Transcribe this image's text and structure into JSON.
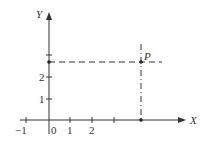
{
  "diagram": {
    "title": "",
    "axes": {
      "x_label": "X",
      "y_label": "Y"
    },
    "x_ticks": [
      {
        "value": -1,
        "label": "−1"
      },
      {
        "value": 0,
        "label": "0"
      },
      {
        "value": 1,
        "label": "1"
      },
      {
        "value": 2,
        "label": "2"
      },
      {
        "value": 3,
        "label": ""
      }
    ],
    "y_ticks": [
      {
        "value": 1,
        "label": "1"
      },
      {
        "value": 2,
        "label": "2"
      },
      {
        "value": 3,
        "label": ""
      }
    ],
    "point": {
      "label": "P"
    },
    "colors": {
      "ink": "#333333"
    }
  }
}
